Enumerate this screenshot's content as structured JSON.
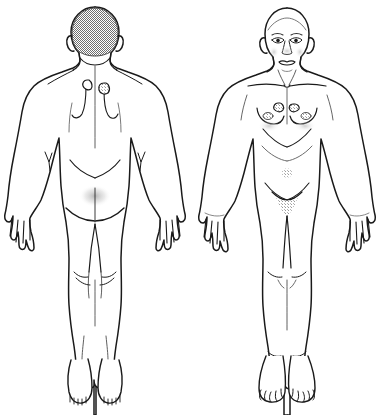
{
  "document": {
    "title": "Human Body Map",
    "subtitle": "Posterior and Anterior Views",
    "background_color": "#ffffff",
    "ink_color": "#1a1a1a",
    "shade_color": "#9a9a9a",
    "width": 382,
    "height": 415
  },
  "caption": {
    "text": "",
    "visible": false
  },
  "figures": [
    {
      "id": "posterior",
      "view_label": "Posterior (Back) View",
      "center_x": 95,
      "features": [
        {
          "name": "head",
          "label": "Head with hair",
          "shaded": true,
          "shade": "halftone-gray"
        },
        {
          "name": "neck",
          "label": "Neck"
        },
        {
          "name": "shoulders",
          "label": "Shoulders"
        },
        {
          "name": "scapula-left",
          "label": "Left shoulder blade marking"
        },
        {
          "name": "scapula-right",
          "label": "Right shoulder blade marking"
        },
        {
          "name": "lesion-upper-left",
          "label": "Marked lesion, upper back left",
          "shaded": false
        },
        {
          "name": "lesion-upper-right",
          "label": "Marked lesion, upper back right",
          "shaded": true
        },
        {
          "name": "elbow-left",
          "label": "Left elbow crease"
        },
        {
          "name": "elbow-right",
          "label": "Right elbow crease"
        },
        {
          "name": "buttocks",
          "label": "Gluteal fold"
        },
        {
          "name": "hand-left",
          "label": "Left hand"
        },
        {
          "name": "hand-right",
          "label": "Right hand"
        },
        {
          "name": "knee-left",
          "label": "Left popliteal fossa"
        },
        {
          "name": "knee-right",
          "label": "Right popliteal fossa"
        },
        {
          "name": "foot-left",
          "label": "Left heel"
        },
        {
          "name": "foot-right",
          "label": "Right heel"
        }
      ]
    },
    {
      "id": "anterior",
      "view_label": "Anterior (Front) View",
      "center_x": 287,
      "features": [
        {
          "name": "face",
          "label": "Face with eyes, nose and mouth"
        },
        {
          "name": "neck",
          "label": "Neck with sternocleidomastoid"
        },
        {
          "name": "clavicles",
          "label": "Clavicles"
        },
        {
          "name": "breast-left",
          "label": "Left breast"
        },
        {
          "name": "breast-right",
          "label": "Right breast"
        },
        {
          "name": "lesion-chest-left",
          "label": "Marked lesion, left chest",
          "shaded": true
        },
        {
          "name": "lesion-chest-right",
          "label": "Marked lesion, right chest",
          "shaded": true
        },
        {
          "name": "ribcage",
          "label": "Costal margin"
        },
        {
          "name": "navel",
          "label": "Umbilicus",
          "shaded": true
        },
        {
          "name": "pubis",
          "label": "Pubic region",
          "shaded": true
        },
        {
          "name": "hand-left",
          "label": "Left hand"
        },
        {
          "name": "hand-right",
          "label": "Right hand"
        },
        {
          "name": "knee-left",
          "label": "Left knee"
        },
        {
          "name": "knee-right",
          "label": "Right knee"
        },
        {
          "name": "foot-left",
          "label": "Left foot with toes"
        },
        {
          "name": "foot-right",
          "label": "Right foot with toes"
        }
      ]
    }
  ]
}
